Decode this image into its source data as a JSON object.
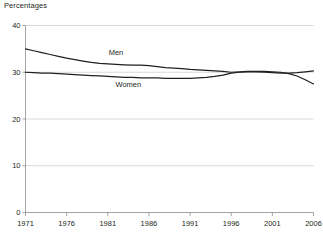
{
  "chart_data": {
    "type": "line",
    "title": "Percentages",
    "xlabel": "",
    "ylabel": "",
    "ylim": [
      0,
      40
    ],
    "xlim": [
      1971,
      2006
    ],
    "yticks": [
      "0",
      "10",
      "20",
      "30",
      "40"
    ],
    "ytick_values": [
      0,
      10,
      20,
      30,
      40
    ],
    "xticks": [
      "1971",
      "1976",
      "1981",
      "1986",
      "1991",
      "1996",
      "2001",
      "2006"
    ],
    "xtick_values": [
      1971,
      1976,
      1981,
      1986,
      1991,
      1996,
      2001,
      2006
    ],
    "grid": true,
    "grid_axis": "y",
    "legend": "inline-labels",
    "x": [
      1971,
      1972,
      1973,
      1974,
      1975,
      1976,
      1977,
      1978,
      1979,
      1980,
      1981,
      1982,
      1983,
      1984,
      1985,
      1986,
      1987,
      1988,
      1989,
      1990,
      1991,
      1992,
      1993,
      1994,
      1995,
      1996,
      1997,
      1998,
      1999,
      2000,
      2001,
      2002,
      2003,
      2004,
      2005,
      2006
    ],
    "series": [
      {
        "name": "Men",
        "color": "#231f20",
        "values": [
          35.0,
          34.6,
          34.2,
          33.8,
          33.4,
          33.0,
          32.7,
          32.4,
          32.1,
          31.9,
          31.8,
          31.7,
          31.6,
          31.5,
          31.5,
          31.4,
          31.2,
          31.0,
          30.9,
          30.8,
          30.6,
          30.5,
          30.4,
          30.3,
          30.2,
          30.0,
          30.1,
          30.2,
          30.2,
          30.2,
          30.1,
          30.0,
          29.7,
          29.2,
          28.4,
          27.5
        ],
        "label_position": {
          "x": 1982.0,
          "y": 33.6
        }
      },
      {
        "name": "Women",
        "color": "#231f20",
        "values": [
          30.0,
          29.9,
          29.8,
          29.8,
          29.7,
          29.6,
          29.5,
          29.4,
          29.3,
          29.2,
          29.1,
          29.0,
          28.9,
          28.9,
          28.8,
          28.8,
          28.8,
          28.7,
          28.7,
          28.7,
          28.7,
          28.8,
          28.9,
          29.1,
          29.4,
          29.8,
          30.0,
          30.1,
          30.1,
          30.0,
          29.9,
          29.8,
          29.8,
          29.9,
          30.1,
          30.3
        ],
        "label_position": {
          "x": 1983.5,
          "y": 26.9
        }
      }
    ]
  },
  "labels": {
    "axis_title": "Percentages",
    "men": "Men",
    "women": "Women"
  }
}
